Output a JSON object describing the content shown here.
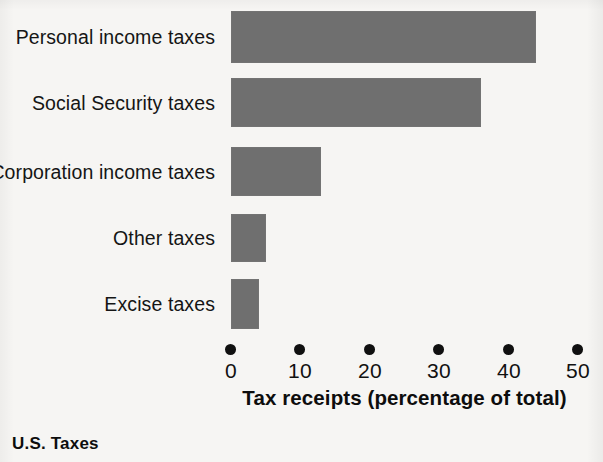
{
  "caption": "U.S. Taxes",
  "chart_data": {
    "type": "bar",
    "orientation": "horizontal",
    "title": "",
    "subtitle": "",
    "categories": [
      "Personal income taxes",
      "Social Security taxes",
      "Corporation income taxes",
      "Other taxes",
      "Excise taxes"
    ],
    "values": [
      44,
      36,
      13,
      5,
      4
    ],
    "xlabel": "Tax receipts (percentage of total)",
    "ylabel": "",
    "xlim": [
      0,
      50
    ],
    "xticks": [
      0,
      10,
      20,
      30,
      40,
      50
    ],
    "xtick_labels": [
      "0",
      "10",
      "20",
      "30",
      "40",
      "50"
    ],
    "grid": false,
    "legend": null,
    "bar_color": "#6f6f6f",
    "background_color": "#f6f5f3",
    "text_color": "#111111",
    "tick_marker": "dot"
  }
}
